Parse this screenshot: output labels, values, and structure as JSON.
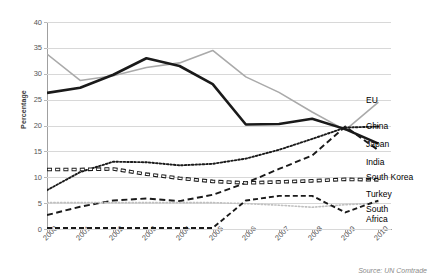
{
  "chart_data": {
    "type": "line",
    "title": "",
    "xlabel": "",
    "ylabel": "Percentage",
    "ylim": [
      0,
      40
    ],
    "yticks": [
      0,
      5,
      10,
      15,
      20,
      25,
      30,
      35,
      40
    ],
    "grid": true,
    "legend_position": "right-inline",
    "source_note": "Source: UN Comtrade",
    "categories": [
      "2000",
      "2001",
      "2002",
      "2003",
      "2004",
      "2005",
      "2006",
      "2007",
      "2008",
      "2009",
      "2010"
    ],
    "series": [
      {
        "name": "EU",
        "color": "#aaaaaa",
        "style": "solid-thin",
        "values": [
          33.8,
          28.7,
          29.6,
          31.2,
          32.1,
          34.5,
          29.4,
          26.4,
          22.6,
          19.1,
          24.5
        ]
      },
      {
        "name": "China",
        "color": "#1a1a1a",
        "style": "solid-thick",
        "values": [
          26.3,
          27.3,
          29.8,
          33.0,
          31.5,
          28.0,
          20.2,
          20.3,
          21.3,
          19.3,
          16.5
        ]
      },
      {
        "name": "Japan",
        "color": "#1a1a1a",
        "style": "dotted",
        "values": [
          7.5,
          11.0,
          13.0,
          12.9,
          12.3,
          12.6,
          13.6,
          15.3,
          17.4,
          19.6,
          19.8
        ]
      },
      {
        "name": "India",
        "color": "#1a1a1a",
        "style": "dashed-long",
        "values": [
          2.7,
          4.3,
          5.5,
          5.9,
          5.4,
          6.6,
          8.9,
          11.6,
          14.2,
          19.8,
          15.2
        ]
      },
      {
        "name": "South Korea",
        "color": "#1a1a1a",
        "style": "chain-oval",
        "values": [
          11.5,
          11.5,
          11.6,
          10.6,
          9.8,
          9.2,
          8.9,
          9.1,
          9.3,
          9.6,
          9.5
        ]
      },
      {
        "name": "Turkey",
        "color": "#c0c0c0",
        "style": "dotted-light",
        "values": [
          5.1,
          5.1,
          5.1,
          5.1,
          5.1,
          5.1,
          4.9,
          4.6,
          4.2,
          4.7,
          5.0
        ]
      },
      {
        "name": "South Africa",
        "color": "#1a1a1a",
        "style": "dashed-short",
        "values": [
          0.2,
          0.2,
          0.2,
          0.2,
          0.2,
          0.2,
          5.5,
          6.4,
          6.4,
          3.2,
          5.5
        ]
      }
    ],
    "legend_labels": [
      {
        "text": "EU",
        "y": 95
      },
      {
        "text": "China",
        "y": 121
      },
      {
        "text": "Japan",
        "y": 139
      },
      {
        "text": "India",
        "y": 157
      },
      {
        "text": "South Korea",
        "y": 172
      },
      {
        "text": "Turkey",
        "y": 189
      },
      {
        "text": "South",
        "y": 204
      },
      {
        "text": "Africa",
        "y": 214
      }
    ]
  }
}
